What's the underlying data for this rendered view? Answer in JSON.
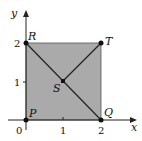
{
  "diagram": {
    "axes": {
      "x_label": "x",
      "y_label": "y"
    },
    "ticks": {
      "x": [
        "0",
        "1",
        "2"
      ],
      "y": [
        "1",
        "2"
      ]
    },
    "points": [
      {
        "name": "P",
        "x": 0,
        "y": 0
      },
      {
        "name": "Q",
        "x": 2,
        "y": 0
      },
      {
        "name": "R",
        "x": 0,
        "y": 2
      },
      {
        "name": "S",
        "x": 1,
        "y": 1
      },
      {
        "name": "T",
        "x": 2,
        "y": 2
      }
    ],
    "region": "square PQTR shaded",
    "segments": [
      "RQ",
      "ST"
    ],
    "colors": {
      "fill": "#a9a9a9",
      "stroke": "#222222"
    }
  }
}
